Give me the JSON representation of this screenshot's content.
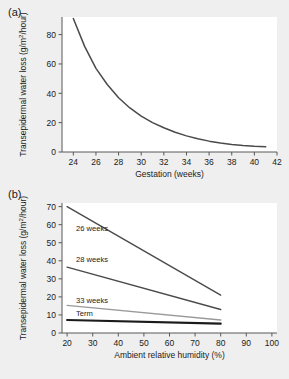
{
  "figure": {
    "background_color": "#efefef",
    "panel_background_color": "#ffffff",
    "axis_color": "#58585a"
  },
  "panel_a": {
    "label": "(a)",
    "chart_data": {
      "type": "line",
      "title": "",
      "xlabel": "Gestation (weeks)",
      "ylabel": "Transepidermal water loss (g/m²/hour)",
      "xlim": [
        23,
        42
      ],
      "ylim": [
        0,
        92
      ],
      "xticks": [
        24,
        26,
        28,
        30,
        32,
        34,
        36,
        38,
        40,
        42
      ],
      "yticks": [
        0,
        20,
        40,
        60,
        80
      ],
      "grid": false,
      "legend": "none",
      "series": [
        {
          "name": "Transepidermal water loss vs gestation",
          "color": "#4a4a4c",
          "x": [
            24,
            25,
            26,
            27,
            28,
            29,
            30,
            31,
            32,
            33,
            34,
            35,
            36,
            37,
            38,
            39,
            40,
            41
          ],
          "values": [
            91,
            72,
            57,
            46,
            37,
            30,
            24.5,
            20,
            16.5,
            13.5,
            11,
            9,
            7.4,
            6.1,
            5.1,
            4.4,
            3.9,
            3.6
          ]
        }
      ]
    }
  },
  "panel_b": {
    "label": "(b)",
    "chart_data": {
      "type": "line",
      "title": "",
      "xlabel": "Ambient relative humidity (%)",
      "ylabel": "Transepidermal water loss (g/m²/hour)",
      "xlim": [
        18,
        102
      ],
      "ylim": [
        0,
        72
      ],
      "xticks": [
        20,
        30,
        40,
        50,
        60,
        70,
        80,
        90,
        100
      ],
      "yticks": [
        0,
        10,
        20,
        30,
        40,
        50,
        60,
        70
      ],
      "grid": false,
      "legend": "inline-labels",
      "x": [
        20,
        80
      ],
      "series": [
        {
          "name": "26 weeks",
          "color": "#4a4a4c",
          "width": 1.4,
          "values": [
            70,
            21
          ]
        },
        {
          "name": "28 weeks",
          "color": "#4a4a4c",
          "width": 1.4,
          "values": [
            36.5,
            13
          ]
        },
        {
          "name": "33 weeks",
          "color": "#9a9a9c",
          "width": 1.4,
          "values": [
            15.3,
            7.2
          ]
        },
        {
          "name": "Term",
          "color": "#1b1b1b",
          "width": 2.2,
          "values": [
            7.2,
            5.2
          ]
        }
      ],
      "annotations": [
        {
          "text": "26 weeks",
          "x": 23.5,
          "y": 56.5
        },
        {
          "text": "28 weeks",
          "x": 23.5,
          "y": 39.5
        },
        {
          "text": "33 weeks",
          "x": 23.5,
          "y": 16.8
        },
        {
          "text": "Term",
          "x": 23.5,
          "y": 9.6
        }
      ]
    }
  }
}
